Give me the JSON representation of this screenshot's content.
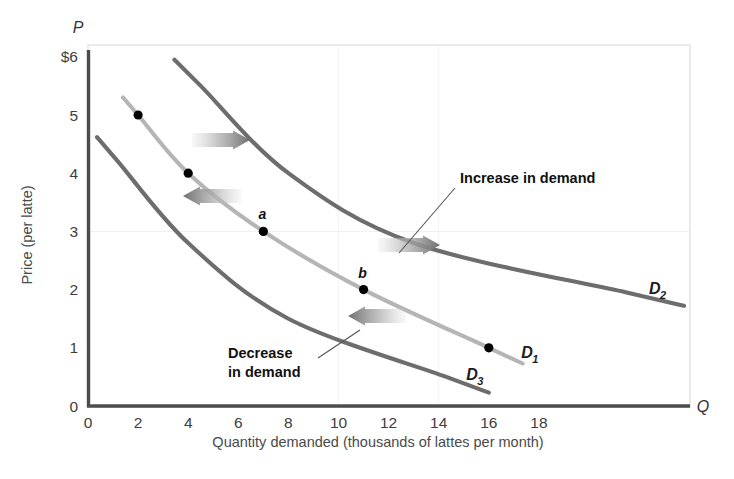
{
  "chart_data": {
    "type": "line",
    "title": "",
    "xlabel": "Quantity demanded (thousands of lattes per month)",
    "ylabel": "Price (per latte)",
    "x_axis_symbol": "Q",
    "y_axis_symbol": "P",
    "xlim": [
      0,
      20
    ],
    "ylim": [
      0,
      6
    ],
    "grid": false,
    "legend": "inline curve labels",
    "x_ticks": [
      "0",
      "2",
      "4",
      "6",
      "8",
      "10",
      "12",
      "14",
      "16",
      "18"
    ],
    "x_tick_values": [
      0,
      2,
      4,
      6,
      8,
      10,
      12,
      14,
      16,
      18
    ],
    "y_ticks": [
      "0",
      "1",
      "2",
      "3",
      "4",
      "5",
      "$6"
    ],
    "y_tick_values": [
      0,
      1,
      2,
      3,
      4,
      5,
      6
    ],
    "series": [
      {
        "name": "D1",
        "label": "D",
        "subscript": "1",
        "color": "#b5b5b5",
        "role": "original demand curve",
        "points": [
          {
            "q": 2,
            "p": 5,
            "marker": true,
            "label": ""
          },
          {
            "q": 4,
            "p": 4,
            "marker": true,
            "label": ""
          },
          {
            "q": 7,
            "p": 3,
            "marker": true,
            "label": "a"
          },
          {
            "q": 11,
            "p": 2,
            "marker": true,
            "label": "b"
          },
          {
            "q": 16,
            "p": 1,
            "marker": true,
            "label": ""
          }
        ],
        "label_position": {
          "q": 17.3,
          "p": 0.83
        }
      },
      {
        "name": "D2",
        "label": "D",
        "subscript": "2",
        "color": "#6d6d6d",
        "role": "increased demand curve (shift right)",
        "points": [
          {
            "q": 4.5,
            "p": 5.5,
            "marker": false,
            "label": ""
          },
          {
            "q": 8,
            "p": 4,
            "marker": false,
            "label": ""
          },
          {
            "q": 13,
            "p": 2.8,
            "marker": false,
            "label": ""
          },
          {
            "q": 21.5,
            "p": 1.95,
            "marker": false,
            "label": ""
          }
        ],
        "label_position": {
          "q": 22.4,
          "p": 1.92
        }
      },
      {
        "name": "D3",
        "label": "D",
        "subscript": "3",
        "color": "#6d6d6d",
        "role": "decreased demand curve (shift left)",
        "points": [
          {
            "q": 1.2,
            "p": 4.2,
            "marker": false,
            "label": ""
          },
          {
            "q": 4,
            "p": 2.8,
            "marker": false,
            "label": ""
          },
          {
            "q": 8,
            "p": 1.5,
            "marker": false,
            "label": ""
          },
          {
            "q": 14.3,
            "p": 0.5,
            "marker": false,
            "label": ""
          }
        ],
        "label_position": {
          "q": 15.1,
          "p": 0.45
        }
      }
    ],
    "annotations": [
      {
        "name": "increase-in-demand",
        "text": "Increase in demand",
        "text_lines": [
          "Increase in demand"
        ],
        "x": 460,
        "y": 183,
        "leader": {
          "x1": 455,
          "y1": 188,
          "x2": 399,
          "y2": 253
        }
      },
      {
        "name": "decrease-in-demand",
        "text": "Decrease in demand",
        "text_lines": [
          "Decrease",
          "in demand"
        ],
        "x": 228,
        "y": 358,
        "leader": {
          "x1": 318,
          "y1": 358,
          "x2": 360,
          "y2": 330
        }
      }
    ],
    "shift_arrows": [
      {
        "name": "increase-arrow-upper",
        "direction": "right",
        "x": 192,
        "y": 140,
        "length": 58
      },
      {
        "name": "decrease-arrow-upper",
        "direction": "left",
        "x": 183,
        "y": 196,
        "length": 58
      },
      {
        "name": "increase-arrow-lower",
        "direction": "right",
        "x": 378,
        "y": 245,
        "length": 62
      },
      {
        "name": "decrease-arrow-lower",
        "direction": "left",
        "x": 348,
        "y": 316,
        "length": 58
      }
    ],
    "colors": {
      "axis": "#4d4d4d",
      "frame": "#d9d9d9",
      "d1": "#b5b5b5",
      "d2": "#6d6d6d",
      "d3": "#6d6d6d",
      "marker": "#000000",
      "arrow": "#8c8c8c",
      "text": "#333333"
    }
  }
}
